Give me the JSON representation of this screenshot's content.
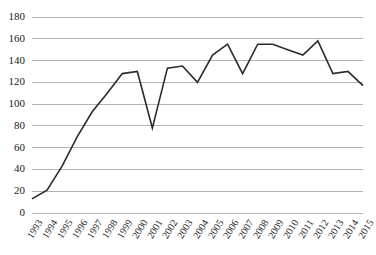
{
  "chart_data": {
    "type": "line",
    "title": "",
    "subtitle": "",
    "xlabel": "",
    "ylabel": "",
    "grid": true,
    "legend": false,
    "legend_position": "none",
    "line_color": "#2b2b2b",
    "grid_color": "#b3b3b3",
    "background_color": "#ffffff",
    "xlim": [
      1993,
      2015
    ],
    "ylim": [
      0,
      180
    ],
    "ytick_step": 20,
    "ytick_labels": [
      "0",
      "20",
      "40",
      "60",
      "80",
      "100",
      "120",
      "140",
      "160",
      "180"
    ],
    "ytick_values": [
      0,
      20,
      40,
      60,
      80,
      100,
      120,
      140,
      160,
      180
    ],
    "categories": [
      "1993",
      "1994",
      "1995",
      "1996",
      "1997",
      "1998",
      "1999",
      "2000",
      "2001",
      "2002",
      "2003",
      "2004",
      "2005",
      "2006",
      "2007",
      "2008",
      "2009",
      "2010",
      "2011",
      "2012",
      "2013",
      "2014",
      "2015"
    ],
    "x": [
      1993,
      1994,
      1995,
      1996,
      1997,
      1998,
      1999,
      2000,
      2001,
      2002,
      2003,
      2004,
      2005,
      2006,
      2007,
      2008,
      2009,
      2010,
      2011,
      2012,
      2013,
      2014,
      2015
    ],
    "values": [
      13,
      21,
      43,
      70,
      93,
      110,
      128,
      130,
      78,
      133,
      135,
      120,
      145,
      155,
      128,
      155,
      155,
      150,
      145,
      158,
      128,
      130,
      117
    ],
    "series": [
      {
        "name": "series-1",
        "values": [
          13,
          21,
          43,
          70,
          93,
          110,
          128,
          130,
          78,
          133,
          135,
          120,
          145,
          155,
          128,
          155,
          155,
          150,
          145,
          158,
          128,
          130,
          117
        ]
      }
    ]
  }
}
